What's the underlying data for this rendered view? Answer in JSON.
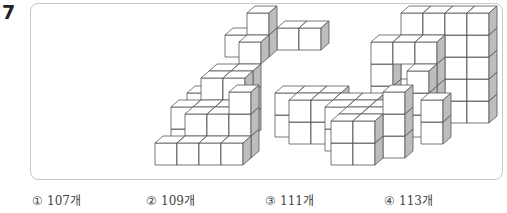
{
  "question": {
    "number": "7"
  },
  "figure": {
    "colors": {
      "front": "#ffffff",
      "top": "#ffffff",
      "side": "#bdbdbd",
      "stroke": "#555555"
    },
    "projection": {
      "size": 22,
      "dx": 8,
      "dy": -7,
      "origin_x": 124,
      "origin_y": 139
    },
    "cubes": [
      [
        0,
        0,
        0
      ],
      [
        1,
        0,
        0
      ],
      [
        2,
        0,
        0
      ],
      [
        3,
        0,
        0
      ],
      [
        1,
        1,
        0
      ],
      [
        2,
        1,
        0
      ],
      [
        3,
        1,
        0
      ],
      [
        1,
        1,
        1
      ],
      [
        2,
        1,
        1
      ],
      [
        3,
        1,
        1
      ],
      [
        3,
        1,
        2
      ],
      [
        0,
        2,
        0
      ],
      [
        1,
        2,
        0
      ],
      [
        2,
        2,
        0
      ],
      [
        0,
        2,
        1
      ],
      [
        1,
        2,
        1
      ],
      [
        2,
        2,
        1
      ],
      [
        1,
        3,
        0
      ],
      [
        2,
        3,
        0
      ],
      [
        1,
        3,
        1
      ],
      [
        2,
        3,
        1
      ],
      [
        1,
        3,
        2
      ],
      [
        2,
        3,
        2
      ],
      [
        0,
        4,
        0
      ],
      [
        1,
        4,
        0
      ],
      [
        2,
        4,
        0
      ],
      [
        0,
        4,
        1
      ],
      [
        1,
        4,
        1
      ],
      [
        2,
        4,
        1
      ],
      [
        1,
        4,
        2
      ],
      [
        2,
        4,
        2
      ],
      [
        2,
        5,
        3
      ],
      [
        1,
        6,
        3
      ],
      [
        2,
        6,
        3
      ],
      [
        2,
        6,
        4
      ],
      [
        3,
        7,
        3
      ],
      [
        4,
        7,
        3
      ],
      [
        8,
        0,
        0
      ],
      [
        8,
        0,
        1
      ],
      [
        9,
        0,
        0
      ],
      [
        9,
        0,
        1
      ],
      [
        8,
        1,
        0
      ],
      [
        9,
        1,
        0
      ],
      [
        10,
        1,
        0
      ],
      [
        8,
        1,
        1
      ],
      [
        9,
        1,
        1
      ],
      [
        10,
        1,
        1
      ],
      [
        10,
        1,
        2
      ],
      [
        7,
        2,
        0
      ],
      [
        8,
        2,
        0
      ],
      [
        9,
        2,
        0
      ],
      [
        7,
        2,
        1
      ],
      [
        8,
        2,
        1
      ],
      [
        9,
        2,
        1
      ],
      [
        5,
        3,
        0
      ],
      [
        6,
        3,
        0
      ],
      [
        7,
        3,
        0
      ],
      [
        8,
        3,
        0
      ],
      [
        5,
        3,
        1
      ],
      [
        6,
        3,
        1
      ],
      [
        7,
        3,
        1
      ],
      [
        8,
        3,
        1
      ],
      [
        11,
        3,
        0
      ],
      [
        11,
        3,
        1
      ],
      [
        4,
        4,
        0
      ],
      [
        5,
        4,
        0
      ],
      [
        6,
        4,
        0
      ],
      [
        4,
        4,
        1
      ],
      [
        5,
        4,
        1
      ],
      [
        6,
        4,
        1
      ],
      [
        10,
        4,
        0
      ],
      [
        10,
        4,
        1
      ],
      [
        10,
        4,
        2
      ],
      [
        10,
        5,
        0
      ],
      [
        10,
        5,
        1
      ],
      [
        10,
        5,
        2
      ],
      [
        10,
        5,
        3
      ],
      [
        8,
        5,
        1
      ],
      [
        8,
        5,
        2
      ],
      [
        8,
        5,
        3
      ],
      [
        9,
        5,
        3
      ],
      [
        8,
        6,
        2
      ],
      [
        9,
        6,
        2
      ],
      [
        9,
        6,
        3
      ],
      [
        9,
        6,
        4
      ],
      [
        10,
        6,
        4
      ],
      [
        11,
        6,
        0
      ],
      [
        11,
        6,
        1
      ],
      [
        11,
        6,
        2
      ],
      [
        11,
        6,
        3
      ],
      [
        11,
        6,
        4
      ],
      [
        12,
        6,
        0
      ],
      [
        12,
        6,
        1
      ],
      [
        12,
        6,
        2
      ],
      [
        12,
        6,
        3
      ],
      [
        12,
        6,
        4
      ]
    ]
  },
  "choices": [
    {
      "mark": "①",
      "label": "107개"
    },
    {
      "mark": "②",
      "label": "109개"
    },
    {
      "mark": "③",
      "label": "111개"
    },
    {
      "mark": "④",
      "label": "113개"
    }
  ]
}
